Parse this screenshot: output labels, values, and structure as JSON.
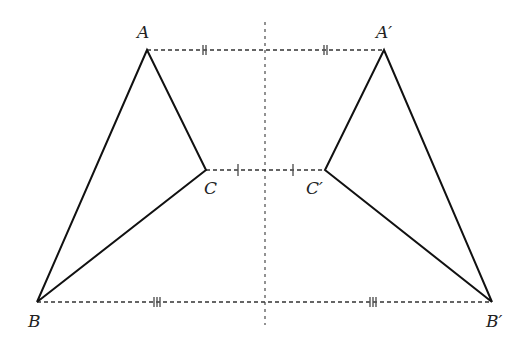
{
  "diagram": {
    "points": {
      "A": {
        "label": "A",
        "x": 147,
        "y": 50
      },
      "B": {
        "label": "B",
        "x": 37,
        "y": 302
      },
      "C": {
        "label": "C",
        "x": 206,
        "y": 170
      },
      "A2": {
        "label": "A′",
        "x": 384,
        "y": 50
      },
      "B2": {
        "label": "B′",
        "x": 492,
        "y": 302
      },
      "C2": {
        "label": "C′",
        "x": 325,
        "y": 170
      }
    },
    "axis": {
      "x": 265,
      "y1": 22,
      "y2": 325,
      "style": "dotted"
    },
    "tick_marks": {
      "AA2": "double",
      "CC2": "single",
      "BB2": "triple"
    },
    "colors": {
      "line": "#111111",
      "dash": "#333333",
      "axis": "#777777"
    }
  }
}
